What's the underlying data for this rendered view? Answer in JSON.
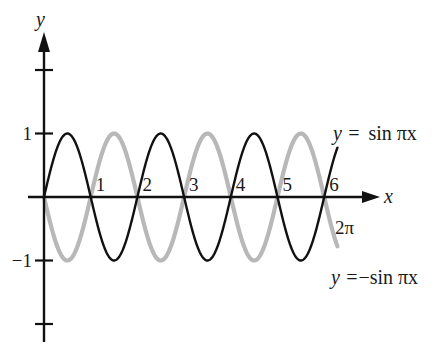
{
  "chart_data": {
    "type": "line",
    "title": "",
    "xlabel": "x",
    "ylabel": "y",
    "xlim": [
      0,
      6.2832
    ],
    "ylim": [
      -2,
      2
    ],
    "x_ticks": [
      {
        "value": 1,
        "label": "1"
      },
      {
        "value": 2,
        "label": "2"
      },
      {
        "value": 3,
        "label": "3"
      },
      {
        "value": 4,
        "label": "4"
      },
      {
        "value": 5,
        "label": "5"
      },
      {
        "value": 6,
        "label": "6"
      }
    ],
    "y_ticks": [
      {
        "value": 2,
        "label": ""
      },
      {
        "value": 1,
        "label": "1"
      },
      {
        "value": -1,
        "label": "−1"
      },
      {
        "value": -2,
        "label": ""
      }
    ],
    "domain_end_label": "2π",
    "domain_end_value": 6.2832,
    "series": [
      {
        "name": "y = sin πx",
        "label_prefix": "y =",
        "label_func": "sin πx",
        "function": "sin(pi*x)",
        "sign": 1,
        "color": "#111111",
        "style": "solid-thin"
      },
      {
        "name": "y =−sin πx",
        "label_prefix": "y =",
        "label_func": "−sin πx",
        "function": "-sin(pi*x)",
        "sign": -1,
        "color": "#b8b8b8",
        "style": "solid-thick"
      }
    ],
    "grid": false,
    "legend": "inline-right"
  }
}
